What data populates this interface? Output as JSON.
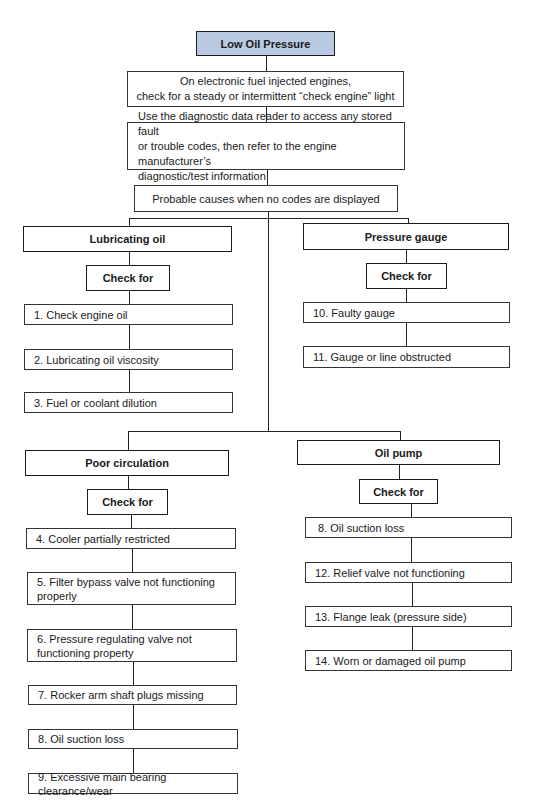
{
  "title": "Low Oil Pressure",
  "steps": [
    "On electronic fuel injected engines,\ncheck for a steady or intermittent “check engine” light",
    "Use the diagnostic data reader to access any stored fault\nor trouble codes, then refer to the engine manufacturer’s\ndiagnostic/test information",
    "Probable causes when no codes are displayed"
  ],
  "colors": {
    "root_fill": "#b9c9e2",
    "line": "#222222"
  },
  "branches": {
    "lubricating_oil": {
      "label": "Lubricating oil",
      "check_label": "Check for",
      "items": [
        "1. Check engine oil",
        "2. Lubricating oil viscosity",
        "3. Fuel or coolant dilution"
      ]
    },
    "pressure_gauge": {
      "label": "Pressure gauge",
      "check_label": "Check for",
      "items": [
        "10. Faulty gauge",
        "11. Gauge or line obstructed"
      ]
    },
    "poor_circulation": {
      "label": "Poor circulation",
      "check_label": "Check for",
      "items": [
        "4. Cooler partially restricted",
        "5. Filter bypass valve not functioning\n    properly",
        "6. Pressure regulating valve not\n    functioning property",
        "7. Rocker arm shaft plugs missing",
        "8. Oil suction loss",
        "9. Excessive main bearing clearance/wear"
      ]
    },
    "oil_pump": {
      "label": "Oil pump",
      "check_label": "Check for",
      "items": [
        "8. Oil suction loss",
        "12. Relief valve not functioning",
        "13. Flange leak (pressure side)",
        "14. Worn or damaged oil pump"
      ]
    }
  }
}
